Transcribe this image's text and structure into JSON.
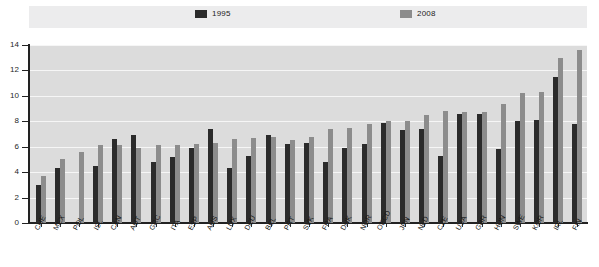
{
  "legend": {
    "items": [
      {
        "label": "1995",
        "color": "#2b2b2b",
        "icon": "legend-swatch-1995"
      },
      {
        "label": "2008",
        "color": "#8c8c8c",
        "icon": "legend-swatch-2008"
      }
    ]
  },
  "axis": {
    "y_ticks": [
      "0",
      "2",
      "4",
      "6",
      "8",
      "10",
      "12",
      "14"
    ]
  },
  "chart_data": {
    "type": "bar",
    "title": "",
    "subtitle": "",
    "xlabel": "",
    "ylabel": "",
    "ylim": [
      0,
      14
    ],
    "ytick_step": 2,
    "grid": true,
    "legend_position": "top",
    "categories": [
      "CHE",
      "MEX",
      "POL",
      "ISL",
      "CAN",
      "AUT",
      "GRC",
      "ITA",
      "ESP",
      "AUS",
      "LUX",
      "DEU",
      "BEL",
      "PRT",
      "SVK",
      "FRA",
      "DNK",
      "NOR",
      "OECD",
      "JPN",
      "NLD",
      "CZE",
      "USA",
      "GBR",
      "HUN",
      "SWE",
      "KOR",
      "IRL",
      "FIN"
    ],
    "series": [
      {
        "name": "1995",
        "color": "#2b2b2b",
        "values": [
          3.0,
          4.3,
          null,
          4.5,
          6.6,
          6.9,
          4.8,
          5.2,
          5.9,
          7.4,
          4.3,
          5.3,
          6.9,
          6.2,
          6.3,
          4.8,
          5.9,
          6.2,
          7.9,
          7.3,
          7.4,
          5.3,
          8.6,
          8.6,
          5.8,
          8.0,
          8.1,
          11.5,
          7.8
        ]
      },
      {
        "name": "2008",
        "color": "#8c8c8c",
        "values": [
          3.7,
          5.0,
          5.6,
          6.1,
          6.1,
          5.9,
          6.1,
          6.1,
          6.2,
          6.3,
          6.6,
          6.7,
          6.8,
          6.5,
          6.8,
          7.4,
          7.5,
          7.8,
          8.0,
          8.0,
          8.5,
          8.8,
          8.7,
          8.7,
          9.4,
          10.2,
          10.3,
          13.0,
          13.6
        ]
      }
    ]
  }
}
